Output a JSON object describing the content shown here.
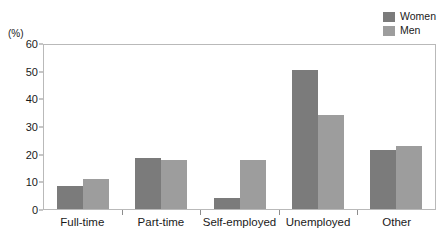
{
  "chart_data": {
    "type": "bar",
    "title": "",
    "xlabel": "",
    "ylabel": "(%)",
    "ylim": [
      0,
      60
    ],
    "yticks": [
      0,
      10,
      20,
      30,
      40,
      50,
      60
    ],
    "grid": false,
    "legend_position": "top-right",
    "categories": [
      "Full-time",
      "Part-time",
      "Self-employed",
      "Unemployed",
      "Other"
    ],
    "series": [
      {
        "name": "Women",
        "color": "#7b7b7b",
        "values": [
          8.5,
          18.5,
          4,
          51,
          21.5
        ]
      },
      {
        "name": "Men",
        "color": "#9d9d9d",
        "values": [
          11,
          18,
          18,
          34.5,
          23
        ]
      }
    ]
  },
  "axis": {
    "unit_label": "(%)",
    "tick_labels": [
      "60",
      "50",
      "40",
      "30",
      "20",
      "10",
      "0"
    ]
  },
  "legend": {
    "items": [
      {
        "label": "Women",
        "color": "#7b7b7b"
      },
      {
        "label": "Men",
        "color": "#9d9d9d"
      }
    ]
  }
}
